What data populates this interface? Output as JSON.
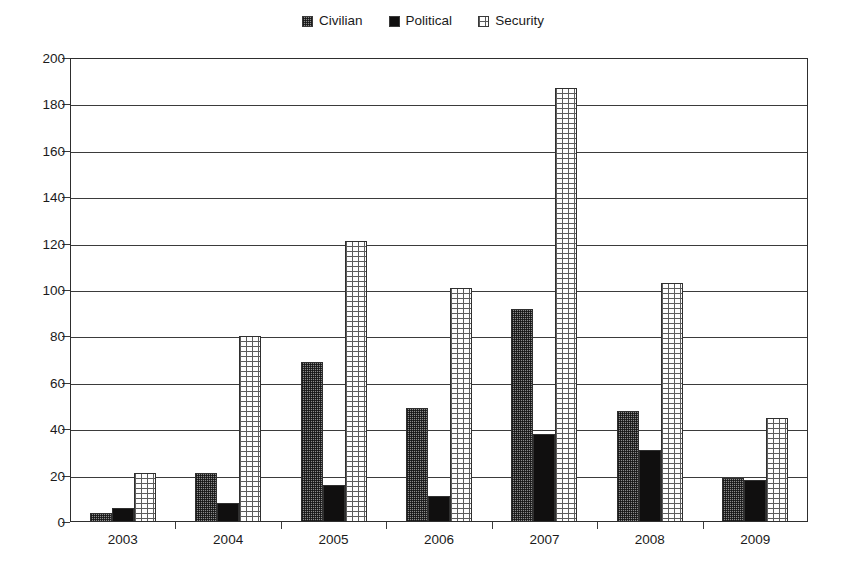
{
  "chart_data": {
    "type": "bar",
    "title": "",
    "subtitle": "",
    "xlabel": "",
    "ylabel": "",
    "categories": [
      "2003",
      "2004",
      "2005",
      "2006",
      "2007",
      "2008",
      "2009"
    ],
    "series": [
      {
        "name": "Civilian",
        "values": [
          4,
          21,
          69,
          49,
          92,
          48,
          19
        ]
      },
      {
        "name": "Political",
        "values": [
          6,
          8,
          16,
          11,
          38,
          31,
          18
        ]
      },
      {
        "name": "Security",
        "values": [
          21,
          80,
          121,
          101,
          187,
          103,
          45
        ]
      }
    ],
    "ylim": [
      0,
      200
    ],
    "ytick_step": 20,
    "yticks": [
      0,
      20,
      40,
      60,
      80,
      100,
      120,
      140,
      160,
      180,
      200
    ],
    "ytick_labels": [
      "0",
      "20",
      "40",
      "60",
      "80",
      "100",
      "120",
      "140",
      "160",
      "180",
      "200"
    ],
    "grid": true,
    "grid_axis": "y",
    "legend_position": "top-center",
    "legend": [
      {
        "label": "Civilian",
        "swatch": "civilian",
        "pattern": "dense-dotted-gray",
        "color": "#8c8c8c"
      },
      {
        "label": "Political",
        "swatch": "political",
        "pattern": "solid",
        "color": "#100f0f"
      },
      {
        "label": "Security",
        "swatch": "security",
        "pattern": "light-brick",
        "color": "#fdfdfd"
      }
    ]
  }
}
